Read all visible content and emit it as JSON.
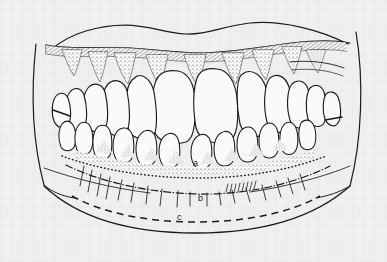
{
  "figure": {
    "kind": "anatomical-line-drawing",
    "background_color": "#efefef",
    "ink_color": "#1c1c1c",
    "tooth_fill_color": "#fafafa",
    "gingiva_stipple_color": "#3a3a3a"
  },
  "labels": {
    "a": "a",
    "b": "b",
    "c": "c"
  },
  "label_meaning": {
    "a": "dotted line along lower gingival margin",
    "b": "dash-dot line across lower lip region",
    "c": "dashed line near lower lip border"
  },
  "line_styles": {
    "a_dotted": "dotted",
    "b_dash_dot": "dash-dot",
    "c_dashed": "dashed"
  },
  "teeth": {
    "upper_visible_count": 14,
    "lower_visible_count": 12,
    "central_incisors": 2
  }
}
